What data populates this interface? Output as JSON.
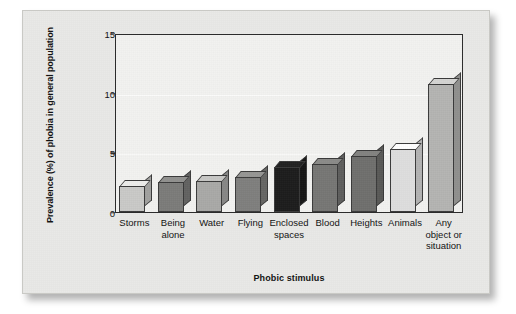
{
  "figure": {
    "background_color": "#e9e9e7",
    "plot_background_color": "#f2f2f0",
    "axis_color": "#2b2b2b"
  },
  "chart_data": {
    "type": "bar",
    "title": "",
    "subtitle": "",
    "xlabel": "Phobic stimulus",
    "ylabel": "Prevalence (%) of phobia in general population",
    "categories": [
      "Storms",
      "Being alone",
      "Water",
      "Flying",
      "Enclosed spaces",
      "Blood",
      "Heights",
      "Animals",
      "Any object or situation"
    ],
    "category_lines": [
      [
        "Storms"
      ],
      [
        "Being",
        "alone"
      ],
      [
        "Water"
      ],
      [
        "Flying"
      ],
      [
        "Enclosed",
        "spaces"
      ],
      [
        "Blood"
      ],
      [
        "Heights"
      ],
      [
        "Animals"
      ],
      [
        "Any",
        "object or",
        "situation"
      ]
    ],
    "values": [
      2.2,
      2.5,
      2.6,
      2.9,
      3.8,
      4.0,
      4.7,
      5.3,
      10.7
    ],
    "bar_colors": [
      "#c9c9c7",
      "#7b7b79",
      "#a9a9a7",
      "#7f7f7d",
      "#1c1c1c",
      "#767674",
      "#6f6f6d",
      "#dedede",
      "#b4b4b2"
    ],
    "ylim": [
      0,
      15
    ],
    "yticks": [
      0,
      5,
      10,
      15
    ],
    "ytick_labels": [
      "0",
      "5",
      "10",
      "15"
    ],
    "grid": true,
    "grid_color": "#fbfbfa",
    "legend": "none",
    "legend_position": "none",
    "annotations": []
  }
}
